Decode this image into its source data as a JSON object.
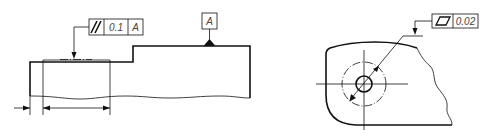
{
  "figure_left": {
    "name": "parallelism-tolerance-example",
    "feature_control_frame": {
      "symbol": "parallelism-icon",
      "tolerance": "0.1",
      "datum": "A"
    },
    "datum_feature": {
      "label": "A"
    }
  },
  "figure_right": {
    "name": "flatness-tolerance-example",
    "feature_control_frame": {
      "symbol": "flatness-icon",
      "tolerance": "0.02"
    }
  },
  "colors": {
    "line": "#111111",
    "text": "#444444",
    "background": "#ffffff"
  }
}
